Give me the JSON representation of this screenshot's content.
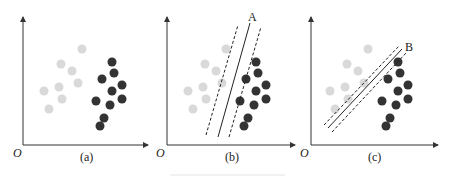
{
  "figure": {
    "panels": [
      {
        "id": "a",
        "label": "(a)",
        "origin_label": "O",
        "offset_x": 0,
        "separator": null
      },
      {
        "id": "b",
        "label": "(b)",
        "origin_label": "O",
        "offset_x": 144,
        "separator": {
          "label": "A",
          "solid": [
            218,
            137,
            250,
            23
          ],
          "margin_left": [
            206,
            135,
            238,
            25
          ],
          "margin_right": [
            229,
            137,
            261,
            27
          ],
          "label_pos": [
            249,
            21
          ]
        }
      },
      {
        "id": "c",
        "label": "(c)",
        "origin_label": "O",
        "offset_x": 286,
        "separator": {
          "label": "B",
          "solid": [
            328,
            128,
            402,
            49
          ],
          "margin_left": [
            324,
            125,
            399,
            46
          ],
          "margin_right": [
            332,
            132,
            406,
            53
          ],
          "label_pos": [
            406,
            50
          ]
        }
      }
    ],
    "class_light": {
      "color": "#d9d9d9",
      "points": [
        [
          82,
          49
        ],
        [
          61,
          64
        ],
        [
          72,
          71
        ],
        [
          78,
          83
        ],
        [
          59,
          87
        ],
        [
          44,
          91
        ],
        [
          62,
          99
        ],
        [
          49,
          109
        ]
      ]
    },
    "class_dark": {
      "color": "#333333",
      "points": [
        [
          112,
          62
        ],
        [
          114,
          73
        ],
        [
          102,
          79
        ],
        [
          122,
          85
        ],
        [
          112,
          91
        ],
        [
          122,
          99
        ],
        [
          96,
          101
        ],
        [
          110,
          105
        ],
        [
          104,
          118
        ],
        [
          100,
          126
        ]
      ]
    },
    "dot_radius": 4.5
  }
}
